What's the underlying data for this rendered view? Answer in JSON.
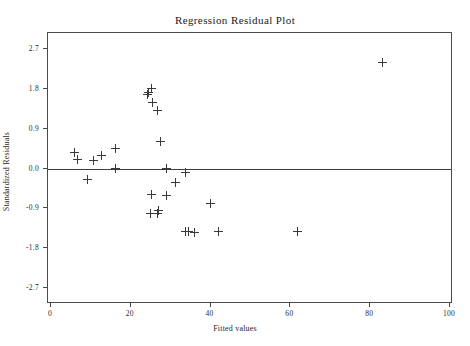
{
  "chart_data": {
    "type": "scatter",
    "title": "Regression Residual Plot",
    "xlabel": "Fitted values",
    "ylabel": "Standardized Residuals",
    "xlim": [
      0,
      100
    ],
    "ylim": [
      -2.7,
      2.7
    ],
    "xticks": [
      0,
      20,
      40,
      60,
      80,
      100
    ],
    "xtick_labels": [
      "0",
      "20",
      "40",
      "60",
      "80",
      "100"
    ],
    "yticks": [
      2.7,
      1.8,
      0.9,
      0.0,
      -0.9,
      -1.8,
      -2.7
    ],
    "ytick_labels": [
      "2.7",
      "1.8",
      "0.9",
      "0.0",
      "-0.9",
      "-1.8",
      "-2.7"
    ],
    "grid": false,
    "legend": null,
    "marker": "plus",
    "marker_color": "#3a3a3a",
    "reference_line": {
      "type": "horizontal",
      "y": 0.0,
      "color": "#3c3c3c"
    },
    "x": [
      6.0,
      6.7,
      10.7,
      12.6,
      9.2,
      16.1,
      16.1,
      24.1,
      24.4,
      25.1,
      25.4,
      26.8,
      27.5,
      29.0,
      31.1,
      33.7,
      25.1,
      29.0,
      34.5,
      41.9,
      24.9,
      26.8,
      27.0,
      33.7,
      36.0,
      40.0,
      61.8,
      83.1
    ],
    "y": [
      0.37,
      0.2,
      0.18,
      0.3,
      -0.25,
      0.0,
      0.45,
      1.68,
      1.72,
      1.8,
      1.5,
      1.32,
      0.6,
      0.0,
      -0.32,
      -0.1,
      -0.58,
      -0.62,
      -1.42,
      -1.42,
      -1.02,
      -1.02,
      -0.95,
      -1.42,
      -1.45,
      -0.78,
      -1.42,
      2.4
    ],
    "n_points": 28
  }
}
